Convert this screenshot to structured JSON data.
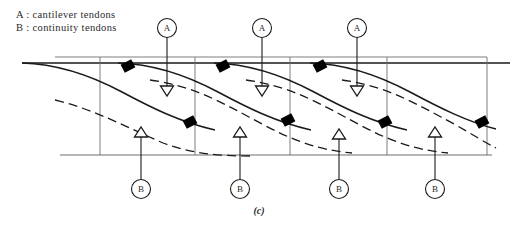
{
  "figure": {
    "caption": "(c)",
    "width": 518,
    "height": 228,
    "background_color": "#ffffff",
    "line_color": "#1a1a1a",
    "grid_color": "#6f6f6f",
    "anchor_color": "#000000"
  },
  "legend": {
    "line_a": "A : cantilever tendons",
    "line_b": "B : continuity tendons"
  },
  "markers": {
    "top_label": "A",
    "bottom_label": "B",
    "top_items": [
      {
        "label": "A",
        "circle_x": 167,
        "circle_y": 28,
        "lead_to_y": 96,
        "arrow_x": 167
      },
      {
        "label": "A",
        "circle_x": 262,
        "circle_y": 28,
        "lead_to_y": 96,
        "arrow_x": 262
      },
      {
        "label": "A",
        "circle_x": 357,
        "circle_y": 28,
        "lead_to_y": 96,
        "arrow_x": 357
      }
    ],
    "bottom_items": [
      {
        "label": "B",
        "circle_x": 141,
        "circle_y": 189,
        "lead_to_y": 127,
        "arrow_x": 141
      },
      {
        "label": "B",
        "circle_x": 240,
        "circle_y": 189,
        "lead_to_y": 127,
        "arrow_x": 240
      },
      {
        "label": "B",
        "circle_x": 339,
        "circle_y": 189,
        "lead_to_y": 129,
        "arrow_x": 339
      },
      {
        "label": "B",
        "circle_x": 435,
        "circle_y": 189,
        "lead_to_y": 127,
        "arrow_x": 435
      }
    ]
  },
  "chart_data": {
    "type": "diagram",
    "xlabel": "",
    "ylabel": "",
    "grid": false,
    "legend_position": "top-left",
    "structure_lines": {
      "top_deck_upper": {
        "x1": 55,
        "y1": 57,
        "x2": 487,
        "y2": 57
      },
      "top_deck_lower": {
        "x1": 22,
        "y1": 63,
        "x2": 510,
        "y2": 63
      },
      "bottom_soffit": {
        "x1": 60,
        "y1": 155,
        "x2": 492,
        "y2": 155
      },
      "verticals": [
        {
          "x": 100,
          "y1": 57,
          "y2": 155
        },
        {
          "x": 195,
          "y1": 57,
          "y2": 155
        },
        {
          "x": 290,
          "y1": 57,
          "y2": 155
        },
        {
          "x": 387,
          "y1": 57,
          "y2": 155
        },
        {
          "x": 487,
          "y1": 57,
          "y2": 155
        }
      ]
    },
    "series": [
      {
        "name": "cantilever tendons (solid)",
        "style": "solid",
        "paths": [
          "M 22,63 C 60,64 92,76 122,92 C 152,108 180,122 215,130",
          "M 118,63 C 156,64 188,76 218,92 C 248,108 276,122 311,130",
          "M 214,63 C 252,64 284,76 314,92 C 344,108 372,122 407,130",
          "M 310,63 C 348,64 380,76 410,92 C 440,108 468,122 496,129"
        ]
      },
      {
        "name": "continuity tendons (dashed)",
        "style": "dashed",
        "paths": [
          "M 55,100 C 96,110 128,128 163,143 C 190,153 215,156 250,156",
          "M 150,80 C 196,86 228,106 262,124 C 292,140 318,150 352,153",
          "M 246,80 C 292,86 324,106 358,124 C 388,140 414,150 448,153",
          "M 342,80 C 388,86 420,106 454,124 C 472,134 484,142 496,148"
        ]
      }
    ],
    "anchor_blocks": [
      {
        "x": 128,
        "y": 66,
        "angle": -28
      },
      {
        "x": 223,
        "y": 66,
        "angle": -28
      },
      {
        "x": 320,
        "y": 66,
        "angle": -28
      },
      {
        "x": 190,
        "y": 122,
        "angle": -28
      },
      {
        "x": 288,
        "y": 120,
        "angle": -28
      },
      {
        "x": 385,
        "y": 122,
        "angle": -28
      },
      {
        "x": 482,
        "y": 122,
        "angle": -28
      }
    ]
  }
}
